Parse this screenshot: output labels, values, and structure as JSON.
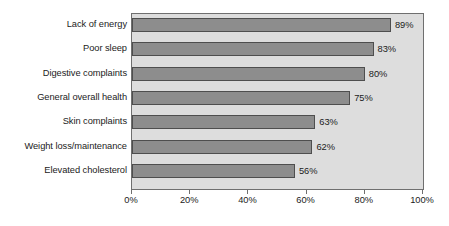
{
  "chart_data": {
    "type": "bar",
    "orientation": "horizontal",
    "title": "",
    "subtitle": "",
    "xlabel": "",
    "ylabel": "",
    "xlim": [
      0,
      100
    ],
    "grid": false,
    "legend": null,
    "categories": [
      "Lack of energy",
      "Poor sleep",
      "Digestive complaints",
      "General overall health",
      "Skin complaints",
      "Weight loss/maintenance",
      "Elevated cholesterol"
    ],
    "values": [
      89,
      83,
      80,
      75,
      63,
      62,
      56
    ],
    "data_labels": [
      "89%",
      "83%",
      "80%",
      "75%",
      "63%",
      "62%",
      "56%"
    ],
    "xticks": [
      0,
      20,
      40,
      60,
      80,
      100
    ],
    "xtick_labels": [
      "0%",
      "20%",
      "40%",
      "60%",
      "80%",
      "100%"
    ],
    "colors": {
      "bar_fill": "#8d8d8d",
      "bar_border": "#4e4e4e",
      "plot_background": "#dddddd",
      "plot_border": "#6f6f6f",
      "page_background": "#ffffff",
      "text": "#1b1b1b"
    }
  }
}
